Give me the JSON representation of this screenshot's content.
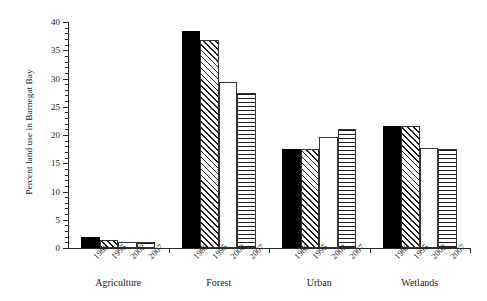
{
  "chart_data": {
    "type": "bar",
    "title": "",
    "subtitle": "",
    "xlabel": "",
    "ylabel": "Percent land use in Barnegat Bay",
    "ylim": [
      0,
      40
    ],
    "ytick_step": 5,
    "yminor_step": 1,
    "grid": false,
    "legend": "none",
    "categories": [
      "Agriculture",
      "Forest",
      "Urban",
      "Wetlands"
    ],
    "series": [
      {
        "name": "1986",
        "pattern": "solid-black",
        "values": [
          1.9,
          38.4,
          17.5,
          21.6
        ]
      },
      {
        "name": "1995",
        "pattern": "diagonal-hatch",
        "values": [
          1.5,
          36.8,
          17.5,
          21.6
        ]
      },
      {
        "name": "2002",
        "pattern": "blank-white",
        "values": [
          1.1,
          29.4,
          19.6,
          17.7
        ]
      },
      {
        "name": "2007",
        "pattern": "horizontal-hatch",
        "values": [
          1.0,
          27.4,
          21.1,
          17.5
        ]
      }
    ],
    "ytick_labels": [
      "0",
      "5",
      "10",
      "15",
      "20",
      "25",
      "30",
      "35",
      "40"
    ],
    "xtick_labels": [
      "1986",
      "1995",
      "2002",
      "2007"
    ]
  },
  "axis": {
    "y_title": "Percent land use in Barnegat Bay"
  }
}
